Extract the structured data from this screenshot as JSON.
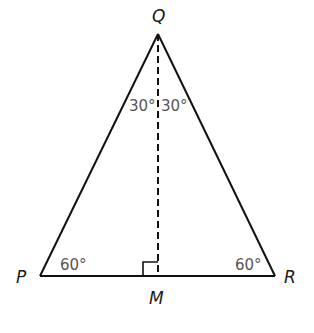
{
  "diagram": {
    "type": "isosceles-triangle-with-altitude",
    "colors": {
      "stroke": "#111111",
      "vertex_label": "#1a1a1a",
      "angle_label": "#555555",
      "background": "#ffffff"
    },
    "vertices": {
      "Q": {
        "label": "Q"
      },
      "P": {
        "label": "P"
      },
      "R": {
        "label": "R"
      },
      "M": {
        "label": "M"
      }
    },
    "angles": {
      "Q_left": "30°",
      "Q_right": "30°",
      "P": "60°",
      "R": "60°",
      "M": "right-angle"
    },
    "segments": [
      {
        "name": "PQ",
        "style": "solid"
      },
      {
        "name": "QR",
        "style": "solid"
      },
      {
        "name": "PR",
        "style": "solid"
      },
      {
        "name": "QM",
        "style": "dashed"
      }
    ]
  }
}
